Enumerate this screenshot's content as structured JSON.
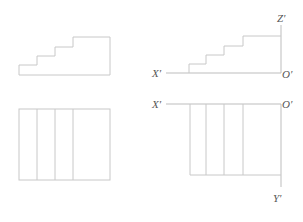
{
  "labels": {
    "z_axis": "Z′",
    "x_axis_top": "X′",
    "origin_top": "O′",
    "x_axis_bottom": "X′",
    "origin_bottom": "O′",
    "y_axis": "Y′"
  },
  "figures": [
    {
      "name": "left-front-view",
      "type": "staircase-profile",
      "steps": 4
    },
    {
      "name": "left-top-view",
      "type": "rectangle-divided",
      "columns": 4
    },
    {
      "name": "right-front-view-with-axes",
      "type": "staircase-profile",
      "steps": 4
    },
    {
      "name": "right-top-view-with-axes",
      "type": "rectangle-divided",
      "columns": 4
    }
  ]
}
